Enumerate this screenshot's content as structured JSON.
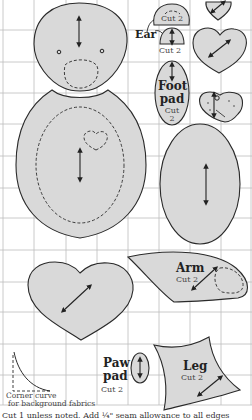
{
  "colors": {
    "piece_fill": "#d9d9d9",
    "outline": "#2a2a2a",
    "grid": "#bdbdbd",
    "background": "#ffffff"
  },
  "pieces": {
    "head": {
      "name": "Head"
    },
    "body": {
      "name": "Body"
    },
    "ear": {
      "label": "Ear",
      "cut_outer": "Cut 2",
      "cut_inner": "Cut 2"
    },
    "foot_pad": {
      "label_line1": "Foot",
      "label_line2": "pad",
      "cut_line1": "Cut",
      "cut_line2": "2"
    },
    "belly": {
      "name": "Belly oval"
    },
    "heart_large": {
      "name": "Heart"
    },
    "arm": {
      "label": "Arm",
      "cut": "Cut 2"
    },
    "paw_pad": {
      "label_line1": "Paw",
      "label_line2": "pad",
      "cut": "Cut 2"
    },
    "leg": {
      "label": "Leg",
      "cut": "Cut 2"
    }
  },
  "corner_curve": {
    "caption_line1": "Corner curve",
    "caption_line2": "for background fabrics"
  },
  "footer": {
    "text": "Cut 1 unless noted. Add ¼\" seam allowance to all edges"
  }
}
